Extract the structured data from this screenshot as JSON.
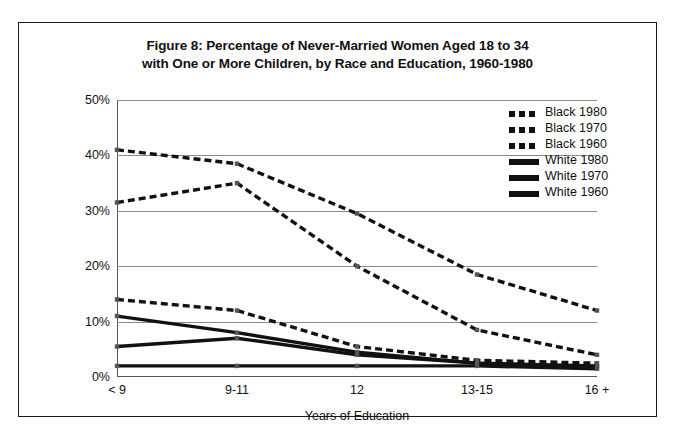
{
  "figure": {
    "title_line_1": "Figure 8: Percentage of Never-Married Women Aged 18 to 34",
    "title_line_2": "with One or More Children, by Race and Education, 1960-1980"
  },
  "chart_data": {
    "type": "line",
    "title": "Figure 8: Percentage of Never-Married Women Aged 18 to 34 with One or More Children, by Race and Education, 1960-1980",
    "xlabel": "Years of Education",
    "ylabel": "",
    "categories": [
      "< 9",
      "9-11",
      "12",
      "13-15",
      "16 +"
    ],
    "ylim": [
      0,
      50
    ],
    "ytick_labels": [
      "0%",
      "10%",
      "20%",
      "30%",
      "40%",
      "50%"
    ],
    "ytick_values": [
      0,
      10,
      20,
      30,
      40,
      50
    ],
    "grid": true,
    "legend_position": "top-right",
    "series": [
      {
        "name": "Black 1980",
        "values": [
          41,
          38.5,
          29.5,
          18.5,
          12
        ],
        "style": "dashed",
        "color": "#111111",
        "width": 3.4
      },
      {
        "name": "Black 1970",
        "values": [
          31.5,
          35,
          20,
          8.5,
          4
        ],
        "style": "dashed",
        "color": "#111111",
        "width": 3.4
      },
      {
        "name": "Black 1960",
        "values": [
          14,
          12,
          5.5,
          3,
          2.5
        ],
        "style": "dashed",
        "color": "#111111",
        "width": 3.4
      },
      {
        "name": "White 1980",
        "values": [
          11,
          8,
          4.5,
          2.5,
          2
        ],
        "style": "solid",
        "color": "#111111",
        "width": 3.4
      },
      {
        "name": "White 1970",
        "values": [
          5.5,
          7,
          4,
          2.5,
          1.8
        ],
        "style": "solid",
        "color": "#111111",
        "width": 3.4
      },
      {
        "name": "White 1960",
        "values": [
          2,
          2,
          2,
          2,
          1.5
        ],
        "style": "solid",
        "color": "#111111",
        "width": 3.4
      }
    ]
  }
}
